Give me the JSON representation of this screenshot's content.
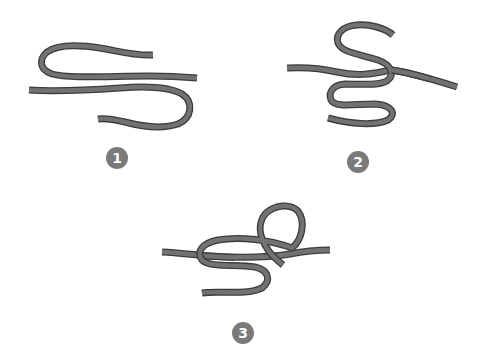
{
  "diagram": {
    "type": "knot-tying-steps",
    "colors": {
      "rope": "#727272",
      "rope_outline": "#3c3c3c",
      "badge": "#7a7a7a",
      "badge_text": "#ffffff",
      "background": "#ffffff"
    },
    "steps": [
      {
        "number": "1",
        "description": "Two rope ends laid parallel, each forming a bight"
      },
      {
        "number": "2",
        "description": "Working end wrapped in S-shape around standing line"
      },
      {
        "number": "3",
        "description": "End passed through loop to form the knot"
      }
    ]
  }
}
